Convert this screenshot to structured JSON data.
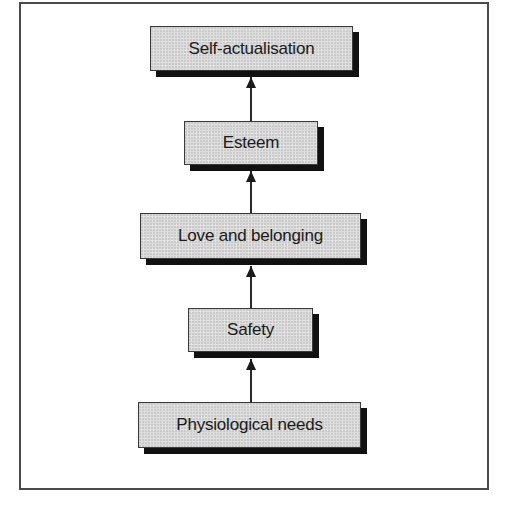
{
  "diagram": {
    "type": "hierarchy-flow",
    "direction": "bottom-to-top",
    "nodes": [
      {
        "id": "self-actualisation",
        "label": "Self-actualisation",
        "level": 5
      },
      {
        "id": "esteem",
        "label": "Esteem",
        "level": 4
      },
      {
        "id": "love-and-belonging",
        "label": "Love and belonging",
        "level": 3
      },
      {
        "id": "safety",
        "label": "Safety",
        "level": 2
      },
      {
        "id": "physiological-needs",
        "label": "Physiological needs",
        "level": 1
      }
    ],
    "edges": [
      {
        "from": "physiological-needs",
        "to": "safety"
      },
      {
        "from": "safety",
        "to": "love-and-belonging"
      },
      {
        "from": "love-and-belonging",
        "to": "esteem"
      },
      {
        "from": "esteem",
        "to": "self-actualisation"
      }
    ],
    "colors": {
      "box_fill": "#dcdcdc",
      "box_border": "#3a3a3a",
      "shadow": "#111111",
      "frame": "#4a4a4a",
      "arrow": "#1a1a1a"
    }
  }
}
